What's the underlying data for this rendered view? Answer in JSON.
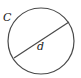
{
  "diagram": {
    "type": "circle-with-diameter",
    "labels": {
      "circumference": "C",
      "diameter": "d"
    },
    "colors": {
      "stroke": "#4a4a4a",
      "text": "#222222",
      "background": "#ffffff"
    }
  }
}
